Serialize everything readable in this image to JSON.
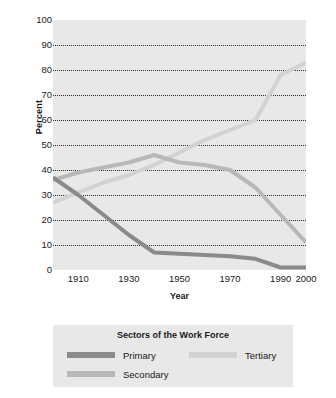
{
  "chart_data": {
    "type": "line",
    "title": "",
    "xlabel": "Year",
    "ylabel": "Percent",
    "xlim": [
      1900,
      2000
    ],
    "ylim": [
      0,
      100
    ],
    "grid": true,
    "legend_position": "bottom",
    "legend_title": "Sectors of the Work Force",
    "xticks": [
      "1910",
      "1930",
      "1950",
      "1970",
      "1990",
      "2000"
    ],
    "xtick_values": [
      1910,
      1930,
      1950,
      1970,
      1990,
      2000
    ],
    "yticks": [
      "0",
      "10",
      "20",
      "30",
      "40",
      "50",
      "60",
      "70",
      "80",
      "90",
      "100"
    ],
    "ytick_values": [
      0,
      10,
      20,
      30,
      40,
      50,
      60,
      70,
      80,
      90,
      100
    ],
    "x": [
      1900,
      1910,
      1920,
      1930,
      1940,
      1950,
      1960,
      1970,
      1980,
      1990,
      2000
    ],
    "series": [
      {
        "name": "Primary",
        "color": "#8a8a8a",
        "values": [
          37,
          30,
          22,
          14,
          7,
          6.5,
          6,
          5.5,
          4.5,
          1,
          1
        ]
      },
      {
        "name": "Secondary",
        "color": "#b8b8b8",
        "values": [
          36,
          39,
          41,
          43,
          46,
          43,
          42,
          40,
          33,
          22,
          11
        ]
      },
      {
        "name": "Tertiary",
        "color": "#d2d2d2",
        "values": [
          27,
          31,
          35,
          38,
          42,
          47,
          52,
          56,
          60,
          78,
          83
        ]
      }
    ]
  },
  "axis": {
    "ylabel": "Percent",
    "xlabel": "Year"
  },
  "legend": {
    "title": "Sectors of the Work Force",
    "entries": [
      {
        "label": "Primary",
        "color": "#8a8a8a"
      },
      {
        "label": "Tertiary",
        "color": "#d2d2d2"
      },
      {
        "label": "Secondary",
        "color": "#b8b8b8"
      }
    ]
  },
  "colors": {
    "plot_background": "#e8e8e8",
    "gridline": "#2b2b2b",
    "primary": "#8a8a8a",
    "secondary": "#b8b8b8",
    "tertiary": "#d2d2d2"
  }
}
